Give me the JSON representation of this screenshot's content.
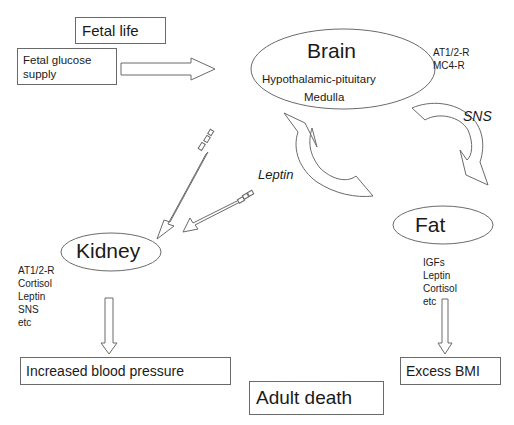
{
  "boxes": {
    "fetal_life": "Fetal life",
    "fetal_glucose_supply_line1": "Fetal glucose",
    "fetal_glucose_supply_line2": "supply",
    "increased_bp": "Increased blood pressure",
    "excess_bmi": "Excess BMI",
    "adult_death": "Adult death"
  },
  "nodes": {
    "brain": {
      "title": "Brain",
      "line1": "Hypothalamic-pituitary",
      "line2": "Medulla"
    },
    "kidney": {
      "title": "Kidney"
    },
    "fat": {
      "title": "Fat"
    }
  },
  "annotations": {
    "brain_receptors": [
      "AT1/2-R",
      "MC4-R"
    ],
    "kidney_factors": [
      "AT1/2-R",
      "Cortisol",
      "Leptin",
      "SNS",
      "etc"
    ],
    "fat_factors": [
      "IGFs",
      "Leptin",
      "Cortisol",
      "etc"
    ]
  },
  "arrow_labels": {
    "leptin": "Leptin",
    "sns": "SNS"
  },
  "colors": {
    "stroke": "#6a6a6a",
    "text": "#1a1a1a"
  }
}
